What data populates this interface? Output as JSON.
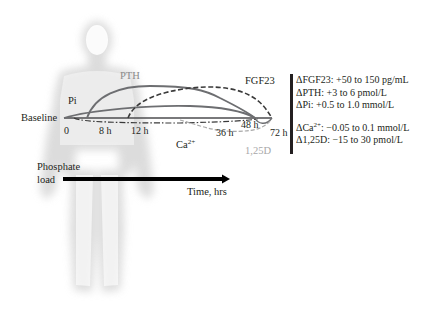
{
  "figure": {
    "baseline_label": "Baseline",
    "curve_labels": {
      "pi": "Pi",
      "pth": "PTH",
      "fgf23": "FGF23",
      "ca_base": "Ca",
      "ca_sup": "2+",
      "d125": "1,25D"
    },
    "time_ticks": [
      "0",
      "8 h",
      "12 h",
      "36 h",
      "48 h",
      "72 h"
    ],
    "phosphate_load": [
      "Phosphate",
      "load"
    ],
    "time_axis_label": "Time, hrs",
    "colors": {
      "text": "#231f20",
      "curve_solid": "#6d6e71",
      "curve_dashed": "#3a3a3a",
      "d125_label": "#a8a8a8",
      "silhouette": "#d9d9d9",
      "arrow": "#000000"
    }
  },
  "legend": {
    "fgf23": "ΔFGF23: +50 to 150 pg/mL",
    "pth": "ΔPTH: +3 to 6 pmol/L",
    "pi": "ΔPi: +0.5 to 1.0 mmol/L",
    "ca_prefix": "ΔCa",
    "ca_sup": "2+",
    "ca_suffix": ": −0.05 to 0.1 mmol/L",
    "d125": "Δ1,25D: −15 to 30 pmol/L"
  }
}
